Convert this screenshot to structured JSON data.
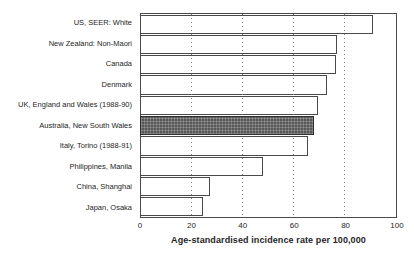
{
  "chart_data": {
    "type": "bar",
    "orientation": "horizontal",
    "title": "",
    "xlabel": "Age-standardised incidence rate per 100,000",
    "categories": [
      "US, SEER: White",
      "New Zealand: Non-Maori",
      "Canada",
      "Denmark",
      "UK, England and Wales (1988-90)",
      "Australia, New South Wales",
      "Italy, Torino (1988-91)",
      "Philippines, Manila",
      "China, Shanghai",
      "Japan, Osaka"
    ],
    "values": [
      91,
      77,
      76.5,
      73,
      69.5,
      68,
      65.5,
      48,
      27,
      24.5
    ],
    "xlim": [
      0,
      100
    ],
    "xticks": [
      0,
      20,
      40,
      60,
      80,
      100
    ],
    "gridlines": [
      20,
      40,
      60,
      80
    ],
    "grid_style": "dotted-vertical",
    "legend": "none",
    "highlight_index": 5,
    "highlight_category": "Australia, New South Wales",
    "colors": {
      "bar_fill": "#ffffff",
      "highlight_fill": "#585858",
      "border": "#4a4a4a",
      "background": "#ffffff",
      "text": "#252525"
    }
  }
}
